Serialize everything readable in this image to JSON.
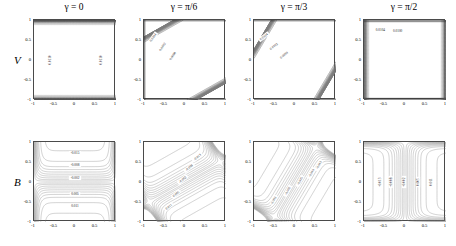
{
  "figure": {
    "width": 456,
    "height": 246,
    "background": "#ffffff",
    "row_labels": [
      "V",
      "B"
    ],
    "column_titles": [
      "γ = 0",
      "γ = π/6",
      "γ = π/3",
      "γ = π/2"
    ],
    "contour_line_color": "#7d7d7d",
    "boundary_color": "#3a3a3a",
    "axis_color": "#4a4a4a"
  },
  "chart_data": {
    "type": "line",
    "xlabel": "",
    "ylabel": "",
    "xlim": [
      -1,
      1
    ],
    "ylim": [
      -1,
      1
    ],
    "xticks": [
      "-1",
      "-0.5",
      "0",
      "0.5",
      "1"
    ],
    "xtick_values": [
      -1,
      -0.5,
      0,
      0.5,
      1
    ],
    "yticks": [
      "1",
      "0.5",
      "0",
      "-0.5",
      "-1"
    ],
    "ytick_values": [
      1,
      0.5,
      0,
      -0.5,
      -1
    ],
    "grid": false,
    "legend": "none",
    "panels": [
      {
        "row": "V",
        "column": 0,
        "gamma": "γ = 0",
        "description": "Velocity contours, Hartmann boundary layers on left and right walls, flat core",
        "labels": [
          {
            "text": "0.0110",
            "x": -0.62,
            "y": 0.0,
            "rot": -90
          },
          {
            "text": "0.0110",
            "x": 0.64,
            "y": 0.0,
            "rot": -90
          }
        ]
      },
      {
        "row": "V",
        "column": 1,
        "gamma": "γ = π/6",
        "description": "Velocity contours tilted, diagonal striping from lower-left to upper-right",
        "labels": [
          {
            "text": "0.0104",
            "x": -0.78,
            "y": 0.56,
            "rot": -55
          },
          {
            "text": "0.0102",
            "x": -0.55,
            "y": 0.33,
            "rot": -55
          },
          {
            "text": "0.0098",
            "x": -0.3,
            "y": 0.1,
            "rot": -55
          }
        ]
      },
      {
        "row": "V",
        "column": 2,
        "gamma": "γ = π/3",
        "description": "Velocity contours strongly tilted, shallow diagonal striping",
        "labels": [
          {
            "text": "0.0104",
            "x": -0.76,
            "y": 0.58,
            "rot": -38
          },
          {
            "text": "0.0102",
            "x": -0.52,
            "y": 0.34,
            "rot": -38
          },
          {
            "text": "0.0099",
            "x": -0.27,
            "y": 0.12,
            "rot": -38
          }
        ]
      },
      {
        "row": "V",
        "column": 3,
        "gamma": "γ = π/2",
        "description": "Velocity contours horizontal, Hartmann layers at top and bottom walls",
        "labels": [
          {
            "text": "0.0104",
            "x": -0.6,
            "y": 0.76,
            "rot": 0
          },
          {
            "text": "0.0100",
            "x": -0.18,
            "y": 0.72,
            "rot": 0
          }
        ]
      },
      {
        "row": "B",
        "column": 0,
        "gamma": "γ = 0",
        "description": "Induced magnetic field, antisymmetric about y = 0, nested horizontal lobes",
        "labels": [
          {
            "text": "-0.015",
            "x": 0.0,
            "y": 0.72,
            "rot": 0
          },
          {
            "text": "-0.008",
            "x": 0.0,
            "y": 0.43,
            "rot": 0
          },
          {
            "text": "-0.002",
            "x": 0.0,
            "y": 0.1,
            "rot": 0
          },
          {
            "text": "0.005",
            "x": 0.0,
            "y": -0.3,
            "rot": 0
          },
          {
            "text": "0.011",
            "x": 0.0,
            "y": -0.6,
            "rot": 0
          }
        ]
      },
      {
        "row": "B",
        "column": 1,
        "gamma": "γ = π/6",
        "description": "Induced magnetic field, contours sweep from upper-right to lower-left",
        "labels": [
          {
            "text": "-0.013",
            "x": 0.3,
            "y": 0.62,
            "rot": -40
          },
          {
            "text": "-0.008",
            "x": 0.1,
            "y": 0.36,
            "rot": -40
          },
          {
            "text": "-0.002",
            "x": -0.06,
            "y": 0.06,
            "rot": -40
          },
          {
            "text": "0.005",
            "x": -0.22,
            "y": -0.3,
            "rot": -40
          },
          {
            "text": "0.011",
            "x": -0.4,
            "y": -0.62,
            "rot": -40
          }
        ]
      },
      {
        "row": "B",
        "column": 2,
        "gamma": "γ = π/3",
        "description": "Induced magnetic field, S-shaped contours running mostly vertically",
        "labels": [
          {
            "text": "-0.013",
            "x": 0.58,
            "y": 0.42,
            "rot": -62
          },
          {
            "text": "-0.010",
            "x": 0.4,
            "y": 0.22,
            "rot": -62
          },
          {
            "text": "-0.005",
            "x": 0.12,
            "y": 0.02,
            "rot": -62
          },
          {
            "text": "-0.002",
            "x": -0.18,
            "y": -0.22,
            "rot": -62
          },
          {
            "text": "0.003",
            "x": -0.52,
            "y": -0.45,
            "rot": -62
          }
        ]
      },
      {
        "row": "B",
        "column": 3,
        "gamma": "γ = π/2",
        "description": "Induced magnetic field, antisymmetric about x = 0, nested vertical lobes",
        "labels": [
          {
            "text": "-0.013",
            "x": -0.62,
            "y": 0.0,
            "rot": -90
          },
          {
            "text": "-0.008",
            "x": -0.35,
            "y": 0.0,
            "rot": -90
          },
          {
            "text": "-0.002",
            "x": -0.02,
            "y": 0.0,
            "rot": -90
          },
          {
            "text": "0.005",
            "x": 0.32,
            "y": 0.0,
            "rot": -90
          },
          {
            "text": "0.011",
            "x": 0.62,
            "y": 0.0,
            "rot": -90
          }
        ]
      }
    ]
  }
}
